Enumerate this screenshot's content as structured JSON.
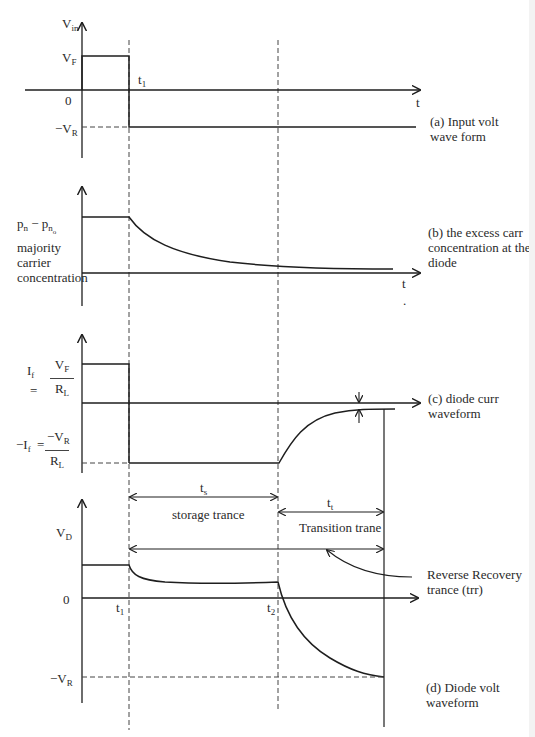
{
  "panels": {
    "a": {
      "caption_line1": "(a) Input volt",
      "caption_line2": "wave form",
      "y_label_main": "V",
      "y_label_sub": "in",
      "vf_main": "V",
      "vf_sub": "F",
      "zero": "0",
      "vr_main": "−V",
      "vr_sub": "R",
      "t1_main": "t",
      "t1_sub": "1",
      "t_axis": "t"
    },
    "b": {
      "caption_line1": "(b) the excess carr",
      "caption_line2": "concentration at the",
      "caption_line3": "diode",
      "y_label_1": "p",
      "y_label_1_sub": "n",
      "y_label_minus": " − p",
      "y_label_2_sub": "n",
      "y_label_2_subsub": "o",
      "y_label_line2": "majority",
      "y_label_line3": "carrier",
      "y_label_line4": "concentration",
      "t_axis": "t",
      "dot": "."
    },
    "c": {
      "caption_line1": "(c) diode curr",
      "caption_line2": "waveform",
      "if_main": "I",
      "if_sub": "f",
      "eq": "=",
      "if_num_main": "V",
      "if_num_sub": "F",
      "if_den_main": "R",
      "if_den_sub": "L",
      "neg_if_main": "−I",
      "neg_if_sub": "f",
      "neg_eq": "=",
      "neg_num_main": "−V",
      "neg_num_sub": "R",
      "neg_den_main": "R",
      "neg_den_sub": "L"
    },
    "d": {
      "caption_line1": "(d) Diode volt",
      "caption_line2": "waveform",
      "y_label_main": "V",
      "y_label_sub": "D",
      "zero": "0",
      "vr_main": "−V",
      "vr_sub": "R",
      "t1_main": "t",
      "t1_sub": "1",
      "t2_main": "t",
      "t2_sub": "2",
      "ts_main": "t",
      "ts_sub": "s",
      "ts_label": "storage trance",
      "tt_main": "t",
      "tt_sub": "t",
      "tt_label": "Transition trane",
      "trr_line1": "Reverse Recovery",
      "trr_line2": "trance (trr)"
    }
  },
  "colors": {
    "line": "#1e1e1e",
    "dashed": "#444444",
    "background": "#ffffff"
  }
}
